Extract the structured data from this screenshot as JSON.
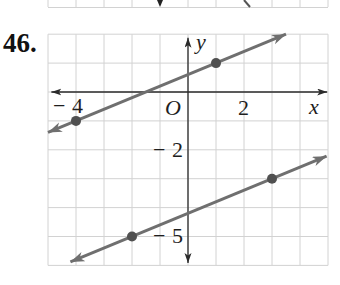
{
  "problem": {
    "number": "46."
  },
  "graph": {
    "axis_labels": {
      "x": "x",
      "y": "y"
    },
    "origin_label": "O",
    "x_tick_labels": [
      "−4",
      "2"
    ],
    "y_tick_labels": [
      "−2",
      "−5"
    ]
  },
  "chart_data": {
    "type": "line",
    "title": "46.",
    "xlabel": "x",
    "ylabel": "y",
    "xlim": [
      -5,
      5
    ],
    "ylim": [
      -6,
      2
    ],
    "grid": true,
    "x_ticks_labeled": [
      -4,
      2
    ],
    "y_ticks_labeled": [
      -2,
      -5
    ],
    "legend": null,
    "series": [
      {
        "name": "upper line",
        "points": [
          [
            -4,
            -1
          ],
          [
            1,
            1
          ]
        ],
        "extent_x": [
          -5,
          3.5
        ],
        "arrows": "both"
      },
      {
        "name": "lower line",
        "points": [
          [
            -2,
            -5
          ],
          [
            3,
            -3
          ]
        ],
        "extent_x": [
          -4.2,
          4.95
        ],
        "arrows": "both"
      }
    ],
    "colors": {
      "line": "#6f6f6f",
      "point": "#505050",
      "grid": "#d2d2d2",
      "axis": "#2b2b2b"
    }
  }
}
